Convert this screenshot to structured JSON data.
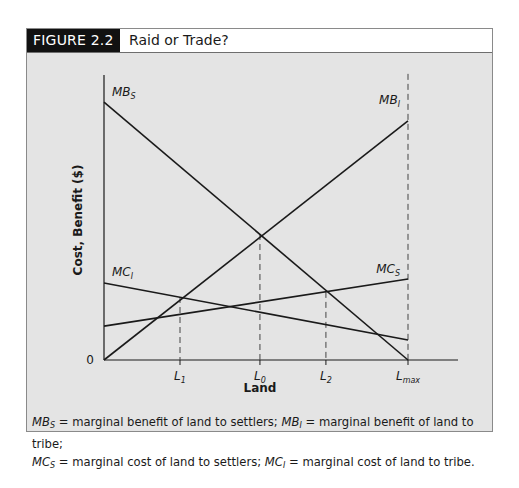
{
  "figure": {
    "label": "FIGURE 2.2",
    "title": "Raid or Trade?"
  },
  "colors": {
    "panel_bg": "#e4e4e4",
    "line": "#1a1a1a",
    "label_bg": "#111111"
  },
  "chart_data": {
    "type": "line",
    "title": "Raid or Trade?",
    "xlabel": "Land",
    "ylabel": "Cost, Benefit ($)",
    "origin_label": "0",
    "xlim": [
      0,
      100
    ],
    "ylim": [
      0,
      100
    ],
    "grid": false,
    "legend": "inline labels",
    "x_ticks": [
      {
        "label": "L",
        "sub": "1",
        "x": 25
      },
      {
        "label": "L",
        "sub": "0",
        "x": 51.3
      },
      {
        "label": "L",
        "sub": "2",
        "x": 73
      },
      {
        "label": "L",
        "sub": "max",
        "x": 100
      }
    ],
    "series": [
      {
        "name": "MB_S",
        "label": "MB",
        "sub": "S",
        "x": [
          0,
          100
        ],
        "y": [
          90.5,
          0
        ]
      },
      {
        "name": "MB_I",
        "label": "MB",
        "sub": "I",
        "x": [
          0,
          100
        ],
        "y": [
          0,
          83.9
        ]
      },
      {
        "name": "MC_S",
        "label": "MC",
        "sub": "S",
        "x": [
          0,
          100
        ],
        "y": [
          11.9,
          28.4
        ]
      },
      {
        "name": "MC_I",
        "label": "MC",
        "sub": "I",
        "x": [
          0,
          100
        ],
        "y": [
          27,
          7
        ]
      }
    ],
    "reference_lines": [
      {
        "type": "dashed-vertical",
        "at": "L1",
        "x": 25,
        "y_top": 22.1
      },
      {
        "type": "dashed-vertical",
        "at": "L0",
        "x": 51.3,
        "y_top": 44.2
      },
      {
        "type": "dashed-vertical",
        "at": "L2",
        "x": 73,
        "y_top": 23.9
      },
      {
        "type": "dashed-vertical",
        "at": "Lmax",
        "x": 100,
        "y_top": 100.4
      }
    ]
  },
  "caption": {
    "line1": [
      {
        "sym": "MB",
        "sub": "S",
        "text": " = marginal benefit of land to settlers; "
      },
      {
        "sym": "MB",
        "sub": "I",
        "text": " = marginal benefit of land to tribe;"
      }
    ],
    "line2": [
      {
        "sym": "MC",
        "sub": "S",
        "text": " = marginal cost of land to settlers; "
      },
      {
        "sym": "MC",
        "sub": "I",
        "text": " = marginal cost of land to tribe."
      }
    ]
  }
}
